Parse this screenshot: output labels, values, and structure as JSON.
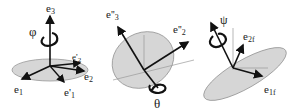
{
  "colors": {
    "disk": "#d4d4d4",
    "disk_stroke": "#888888",
    "arrow": "#111111",
    "line": "#999999"
  },
  "panels": [
    {
      "name": "rotation-phi",
      "angle_label": "φ",
      "axes": [
        {
          "label": "e",
          "sub": "3",
          "prime": ""
        },
        {
          "label": "e",
          "sub": "2",
          "prime": ""
        },
        {
          "label": "e",
          "sub": "2",
          "prime": "'"
        },
        {
          "label": "e",
          "sub": "1",
          "prime": ""
        },
        {
          "label": "e",
          "sub": "1",
          "prime": "'"
        }
      ]
    },
    {
      "name": "rotation-theta",
      "angle_label": "θ",
      "axes": [
        {
          "label": "e",
          "sub": "3",
          "prime": "''"
        },
        {
          "label": "e",
          "sub": "2",
          "prime": "''"
        }
      ]
    },
    {
      "name": "rotation-psi",
      "angle_label": "ψ",
      "axes": [
        {
          "label": "e",
          "sub": "2f",
          "prime": ""
        },
        {
          "label": "e",
          "sub": "1f",
          "prime": ""
        }
      ]
    }
  ]
}
